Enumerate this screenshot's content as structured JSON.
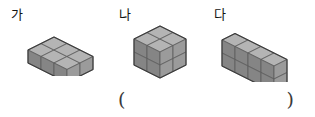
{
  "page": {
    "background_color": "#ffffff",
    "width": 315,
    "height": 117
  },
  "figures": [
    {
      "label": "가",
      "name": "figure-ga",
      "description": "3 by 2 by 1 rectangular slab of unit cubes",
      "dims": {
        "x": 3,
        "y": 2,
        "z": 1
      },
      "cube_count": 6
    },
    {
      "label": "나",
      "name": "figure-na",
      "description": "2 by 2 by 2 cube of unit cubes",
      "dims": {
        "x": 2,
        "y": 2,
        "z": 2
      },
      "cube_count": 8
    },
    {
      "label": "다",
      "name": "figure-da",
      "description": "4 by 1 by 2 wall of unit cubes",
      "dims": {
        "x": 4,
        "y": 1,
        "z": 2
      },
      "cube_count": 8
    }
  ],
  "answer_blank": {
    "open_paren": "(",
    "close_paren": ")",
    "value": ""
  },
  "colors": {
    "face_top": "#b4b4b4",
    "face_left": "#858585",
    "face_right": "#9b9b9b",
    "edge": "#5a5a5a",
    "outline": "#3c3c3c",
    "text": "#131313",
    "paren": "#3a3a3a"
  }
}
